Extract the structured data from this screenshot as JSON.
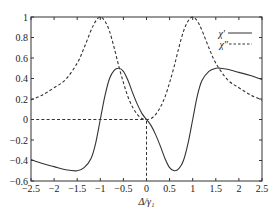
{
  "chart_data": {
    "type": "line",
    "title": "",
    "xlabel": "Δ/γ₁",
    "ylabel": "",
    "xlim": [
      -2.5,
      2.5
    ],
    "ylim": [
      -0.6,
      1.0
    ],
    "xticks": [
      -2.5,
      -2,
      -1.5,
      -1,
      -0.5,
      0,
      0.5,
      1,
      1.5,
      2,
      2.5
    ],
    "xtick_labels": [
      "−2.5",
      "−2",
      "−1.5",
      "−1",
      "−0.5",
      "0",
      "0.5",
      "1",
      "1.5",
      "2",
      "2.5"
    ],
    "yticks": [
      -0.6,
      -0.4,
      -0.2,
      0,
      0.2,
      0.4,
      0.6,
      0.8,
      1
    ],
    "ytick_labels": [
      "−0.6",
      "−0.4",
      "−0.2",
      "0",
      "0.2",
      "0.4",
      "0.6",
      "0.8",
      "1"
    ],
    "grid": false,
    "legend_position": "upper right",
    "series": [
      {
        "name": "χ′",
        "style": "solid",
        "x": [
          -2.5,
          -2.25,
          -2.0,
          -1.75,
          -1.5,
          -1.35,
          -1.2,
          -1.1,
          -1.0,
          -0.9,
          -0.8,
          -0.7,
          -0.6,
          -0.5,
          -0.4,
          -0.3,
          -0.2,
          -0.1,
          0.0,
          0.1,
          0.2,
          0.3,
          0.4,
          0.5,
          0.6,
          0.7,
          0.8,
          0.9,
          1.0,
          1.1,
          1.2,
          1.35,
          1.5,
          1.6,
          1.75,
          2.0,
          2.25,
          2.5
        ],
        "values": [
          -0.39,
          -0.43,
          -0.46,
          -0.49,
          -0.5,
          -0.47,
          -0.38,
          -0.23,
          0.0,
          0.23,
          0.4,
          0.48,
          0.5,
          0.47,
          0.38,
          0.26,
          0.15,
          0.06,
          0.0,
          -0.06,
          -0.15,
          -0.26,
          -0.38,
          -0.47,
          -0.5,
          -0.48,
          -0.4,
          -0.23,
          0.0,
          0.23,
          0.38,
          0.47,
          0.5,
          0.5,
          0.49,
          0.46,
          0.43,
          0.39
        ]
      },
      {
        "name": "χ″",
        "style": "dashed",
        "x": [
          -2.5,
          -2.25,
          -2.0,
          -1.75,
          -1.5,
          -1.35,
          -1.2,
          -1.1,
          -1.0,
          -0.9,
          -0.8,
          -0.7,
          -0.6,
          -0.5,
          -0.4,
          -0.3,
          -0.2,
          -0.1,
          0.0,
          0.1,
          0.2,
          0.3,
          0.4,
          0.5,
          0.6,
          0.7,
          0.8,
          0.9,
          1.0,
          1.1,
          1.2,
          1.35,
          1.5,
          1.75,
          2.0,
          2.25,
          2.5
        ],
        "values": [
          0.19,
          0.24,
          0.31,
          0.39,
          0.55,
          0.7,
          0.87,
          0.96,
          1.0,
          0.96,
          0.86,
          0.7,
          0.52,
          0.36,
          0.22,
          0.12,
          0.05,
          0.01,
          0.0,
          0.01,
          0.05,
          0.12,
          0.22,
          0.36,
          0.52,
          0.7,
          0.86,
          0.96,
          1.0,
          0.96,
          0.87,
          0.7,
          0.55,
          0.39,
          0.31,
          0.24,
          0.19
        ]
      }
    ],
    "annotations": [
      {
        "type": "dashed-line",
        "description": "horizontal dashed reference from x=-2.5 to x=0 at y=0",
        "from": [
          -2.5,
          0
        ],
        "to": [
          0,
          0
        ]
      },
      {
        "type": "dashed-line",
        "description": "vertical dashed reference at x=0 from y=-0.6 to y=0",
        "from": [
          0,
          -0.6
        ],
        "to": [
          0,
          0
        ]
      }
    ]
  },
  "legend": {
    "items": [
      {
        "label": "χ′",
        "style": "solid"
      },
      {
        "label": "χ″",
        "style": "dashed"
      }
    ]
  },
  "colors": {
    "line": "#333333",
    "axis": "#333333",
    "background": "#ffffff"
  }
}
